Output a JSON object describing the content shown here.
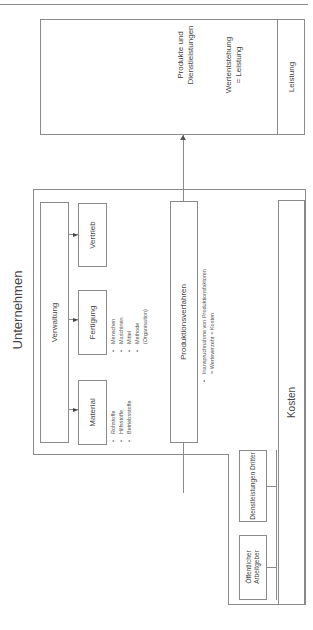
{
  "diagram": {
    "company_title": "Unternehmen",
    "administration": "Verwaltung",
    "departments": [
      {
        "label": "Material",
        "bullets": [
          "Rohstoffe",
          "Hilfsstoffe",
          "Betriebsstoffe"
        ]
      },
      {
        "label": "Fertigung",
        "bullets": [
          "Menschen",
          "Maschinen",
          "Mittel",
          "Methode",
          "(Organisation)"
        ]
      },
      {
        "label": "Vertrieb",
        "bullets": []
      }
    ],
    "production": {
      "label": "Produktionsverfahren",
      "bullets": [
        "Inanspruchnahme von Produktionsfaktoren",
        "= Werteverzehr = Kosten"
      ]
    },
    "costs": "Kosten",
    "external": [
      {
        "label": "Öffentlicher Arbeitgeber"
      },
      {
        "label": "Dienstleistungen Dritter"
      }
    ],
    "output": {
      "products": "Produkte und Dienstleistungen",
      "value_creation": "Wertentstehung",
      "value_equals": "= Leistung",
      "label": "Leistung"
    }
  }
}
